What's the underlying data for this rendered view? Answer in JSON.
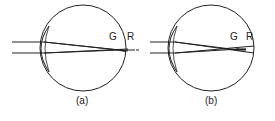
{
  "diagram": {
    "panels": [
      {
        "caption": "(a)",
        "labels": {
          "green_focus": "G",
          "red_focus": "R"
        },
        "description": "Eye with green focus inside retina and red focus behind retina"
      },
      {
        "caption": "(b)",
        "labels": {
          "green_focus": "G",
          "red_focus": "R"
        },
        "description": "Eye with green and red focus points both near the retina"
      }
    ],
    "colors": {
      "stroke": "#222222",
      "background": "#ffffff"
    }
  }
}
